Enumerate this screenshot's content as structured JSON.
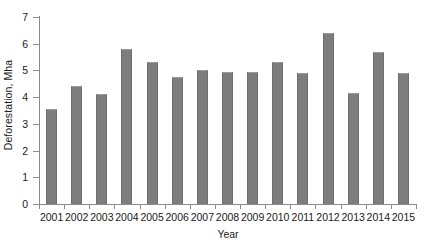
{
  "chart_data": {
    "type": "bar",
    "title": "",
    "xlabel": "Year",
    "ylabel": "Deforestation, Mha",
    "categories": [
      "2001",
      "2002",
      "2003",
      "2004",
      "2005",
      "2006",
      "2007",
      "2008",
      "2009",
      "2010",
      "2011",
      "2012",
      "2013",
      "2014",
      "2015"
    ],
    "values": [
      3.55,
      4.4,
      4.1,
      5.8,
      5.3,
      4.75,
      5.0,
      4.95,
      4.95,
      5.3,
      4.9,
      6.4,
      4.15,
      5.7,
      4.9
    ],
    "ylim": [
      0,
      7
    ],
    "yticks": [
      "0",
      "1",
      "2",
      "3",
      "4",
      "5",
      "6",
      "7"
    ],
    "grid": false,
    "legend": false,
    "bar_color": "#7d7d7d",
    "axis_color": "#8c8c8c",
    "text_color": "#1a1a1a"
  }
}
